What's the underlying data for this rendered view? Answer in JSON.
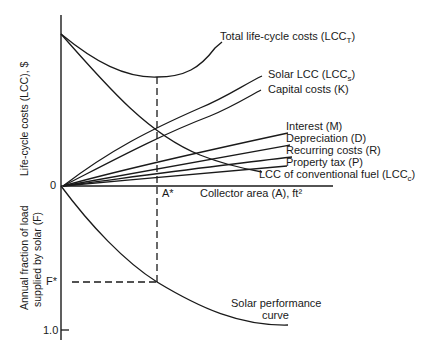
{
  "diagram": {
    "upper_panel": {
      "y_axis_label": "Life-cycle costs (LCC), $",
      "x_axis_label": "Collector area (A), ft²",
      "origin_label": "0",
      "optimum_label": "A*",
      "curves": [
        {
          "id": "total",
          "label": "Total life-cycle costs (LCC",
          "sub": "T",
          "tail": ")"
        },
        {
          "id": "solar",
          "label": "Solar LCC (LCC",
          "sub": "s",
          "tail": ")"
        },
        {
          "id": "capital",
          "label": "Capital costs (K)",
          "sub": "",
          "tail": ""
        },
        {
          "id": "interest",
          "label": "Interest (M)",
          "sub": "",
          "tail": ""
        },
        {
          "id": "depreciation",
          "label": "Depreciation (D)",
          "sub": "",
          "tail": ""
        },
        {
          "id": "recurring",
          "label": "Recurring costs (R)",
          "sub": "",
          "tail": ""
        },
        {
          "id": "property",
          "label": "Property tax (P)",
          "sub": "",
          "tail": ""
        },
        {
          "id": "conventional",
          "label": "LCC of conventional fuel (LCC",
          "sub": "c",
          "tail": ")"
        }
      ]
    },
    "lower_panel": {
      "y_axis_label_line1": "Annual fraction of load",
      "y_axis_label_line2": "supplied by solar (F)",
      "optimum_label": "F*",
      "max_tick_label": "1.0",
      "curve_label_line1": "Solar performance",
      "curve_label_line2": "curve"
    }
  }
}
